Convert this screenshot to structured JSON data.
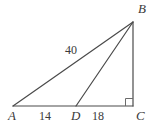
{
  "figure": {
    "type": "geometry-diagram",
    "background_color": "#ffffff",
    "stroke_color": "#4a4a4a",
    "text_color": "#3a3a3a",
    "vertices": [
      {
        "name": "A",
        "label": "A",
        "x": 13,
        "y": 106
      },
      {
        "name": "B",
        "label": "B",
        "x": 133,
        "y": 22
      },
      {
        "name": "C",
        "label": "C",
        "x": 133,
        "y": 106
      },
      {
        "name": "D",
        "label": "D",
        "x": 76,
        "y": 106
      }
    ],
    "segments": [
      {
        "name": "AC",
        "from": "A",
        "to": "C"
      },
      {
        "name": "AB",
        "from": "A",
        "to": "B"
      },
      {
        "name": "DB",
        "from": "D",
        "to": "B"
      },
      {
        "name": "BC",
        "from": "B",
        "to": "C"
      }
    ],
    "measures": [
      {
        "name": "AB",
        "value": "40"
      },
      {
        "name": "AD",
        "value": "14"
      },
      {
        "name": "DC",
        "value": "18"
      }
    ],
    "right_angle": {
      "at": "C",
      "size": 7
    }
  }
}
